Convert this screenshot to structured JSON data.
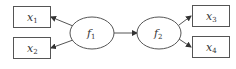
{
  "diagram": {
    "type": "path-diagram",
    "colors": {
      "stroke": "#555555",
      "text": "#333333",
      "background": "#ffffff"
    },
    "latent_factors": [
      {
        "id": "f1",
        "symbol": "f",
        "subscript": "1"
      },
      {
        "id": "f2",
        "symbol": "f",
        "subscript": "2"
      }
    ],
    "observed_variables": [
      {
        "id": "x1",
        "symbol": "x",
        "subscript": "1"
      },
      {
        "id": "x2",
        "symbol": "x",
        "subscript": "2"
      },
      {
        "id": "x3",
        "symbol": "x",
        "subscript": "3"
      },
      {
        "id": "x4",
        "symbol": "x",
        "subscript": "4"
      }
    ],
    "edges": [
      {
        "from": "f1",
        "to": "x1"
      },
      {
        "from": "f1",
        "to": "x2"
      },
      {
        "from": "f1",
        "to": "f2"
      },
      {
        "from": "f2",
        "to": "x3"
      },
      {
        "from": "f2",
        "to": "x4"
      }
    ]
  }
}
